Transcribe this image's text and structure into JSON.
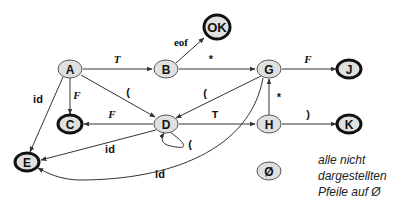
{
  "diagram": {
    "type": "state-machine",
    "colors": {
      "node_fill": "#e0e0e0",
      "node_stroke": "#555555",
      "final_stroke": "#111111",
      "edge": "#333333",
      "text": "#111111"
    },
    "nodes": [
      {
        "id": "A",
        "label": "A",
        "x": 70,
        "y": 69,
        "final": false
      },
      {
        "id": "B",
        "label": "B",
        "x": 166,
        "y": 69,
        "final": false
      },
      {
        "id": "OK",
        "label": "OK",
        "x": 217,
        "y": 27,
        "final": true
      },
      {
        "id": "G",
        "label": "G",
        "x": 269,
        "y": 69,
        "final": false
      },
      {
        "id": "J",
        "label": "J",
        "x": 349,
        "y": 69,
        "final": true
      },
      {
        "id": "C",
        "label": "C",
        "x": 70,
        "y": 124,
        "final": true
      },
      {
        "id": "D",
        "label": "D",
        "x": 166,
        "y": 124,
        "final": false
      },
      {
        "id": "H",
        "label": "H",
        "x": 269,
        "y": 124,
        "final": false
      },
      {
        "id": "K",
        "label": "K",
        "x": 349,
        "y": 124,
        "final": true
      },
      {
        "id": "E",
        "label": "E",
        "x": 27,
        "y": 162,
        "final": true
      },
      {
        "id": "EMPTY",
        "label": "Ø",
        "x": 269,
        "y": 171,
        "final": false
      }
    ],
    "edges": [
      {
        "from": "A",
        "to": "B",
        "label": "T",
        "label_style": "italic-serif"
      },
      {
        "from": "B",
        "to": "OK",
        "label": "eof",
        "label_style": "bold-serif"
      },
      {
        "from": "B",
        "to": "G",
        "label": "*",
        "label_style": "plain"
      },
      {
        "from": "G",
        "to": "J",
        "label": "F",
        "label_style": "italic-serif"
      },
      {
        "from": "A",
        "to": "C",
        "label": "F",
        "label_style": "italic-serif"
      },
      {
        "from": "A",
        "to": "D",
        "label": "(",
        "label_style": "plain"
      },
      {
        "from": "A",
        "to": "E",
        "label": "id",
        "label_style": "bold-sans"
      },
      {
        "from": "G",
        "to": "D",
        "label": "(",
        "label_style": "plain"
      },
      {
        "from": "D",
        "to": "C",
        "label": "F",
        "label_style": "italic-serif"
      },
      {
        "from": "D",
        "to": "H",
        "label": "T",
        "label_style": "mono"
      },
      {
        "from": "D",
        "to": "D",
        "label": "(",
        "label_style": "plain"
      },
      {
        "from": "D",
        "to": "E",
        "label": "id",
        "label_style": "bold-sans"
      },
      {
        "from": "H",
        "to": "G",
        "label": "*",
        "label_style": "plain"
      },
      {
        "from": "H",
        "to": "K",
        "label": ")",
        "label_style": "plain"
      },
      {
        "from": "G",
        "to": "E",
        "label": "id",
        "label_style": "bold-sans"
      }
    ]
  },
  "legend": {
    "lines": [
      "alle nicht",
      "dargestellten",
      "Pfeile auf Ø"
    ]
  }
}
